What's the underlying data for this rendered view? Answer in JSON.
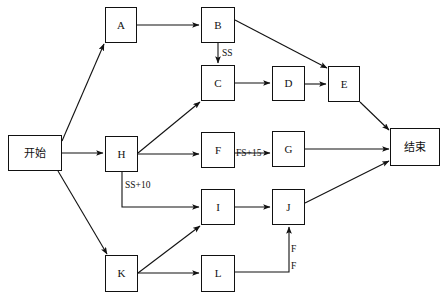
{
  "diagram": {
    "canvas": {
      "width": 446,
      "height": 308,
      "background": "#ffffff"
    },
    "stroke_color": "#111111",
    "nodes": [
      {
        "id": "start",
        "label": "开始",
        "x": 8,
        "y": 135,
        "w": 54,
        "h": 36,
        "type": "terminal"
      },
      {
        "id": "A",
        "label": "A",
        "x": 105,
        "y": 7,
        "w": 32,
        "h": 36,
        "type": "task"
      },
      {
        "id": "B",
        "label": "B",
        "x": 201,
        "y": 7,
        "w": 34,
        "h": 36,
        "type": "task"
      },
      {
        "id": "C",
        "label": "C",
        "x": 201,
        "y": 65,
        "w": 34,
        "h": 36,
        "type": "task"
      },
      {
        "id": "D",
        "label": "D",
        "x": 272,
        "y": 66,
        "w": 33,
        "h": 35,
        "type": "task"
      },
      {
        "id": "E",
        "label": "E",
        "x": 328,
        "y": 66,
        "w": 32,
        "h": 36,
        "type": "task"
      },
      {
        "id": "H",
        "label": "H",
        "x": 105,
        "y": 136,
        "w": 33,
        "h": 36,
        "type": "task"
      },
      {
        "id": "F",
        "label": "F",
        "x": 201,
        "y": 132,
        "w": 34,
        "h": 36,
        "type": "task"
      },
      {
        "id": "G",
        "label": "G",
        "x": 272,
        "y": 131,
        "w": 33,
        "h": 36,
        "type": "task"
      },
      {
        "id": "I",
        "label": "I",
        "x": 201,
        "y": 189,
        "w": 34,
        "h": 36,
        "type": "task"
      },
      {
        "id": "J",
        "label": "J",
        "x": 272,
        "y": 189,
        "w": 33,
        "h": 36,
        "type": "task"
      },
      {
        "id": "K",
        "label": "K",
        "x": 105,
        "y": 255,
        "w": 33,
        "h": 37,
        "type": "task"
      },
      {
        "id": "L",
        "label": "L",
        "x": 201,
        "y": 255,
        "w": 34,
        "h": 37,
        "type": "task"
      },
      {
        "id": "end",
        "label": "结束",
        "x": 390,
        "y": 128,
        "w": 50,
        "h": 38,
        "type": "terminal"
      }
    ],
    "edge_labels": [
      {
        "id": "ss",
        "text": "SS",
        "x": 222,
        "y": 49
      },
      {
        "id": "ss10",
        "text": "SS+10",
        "x": 125,
        "y": 181
      },
      {
        "id": "fs15",
        "text": "FS+15",
        "x": 236,
        "y": 149
      },
      {
        "id": "f-top",
        "text": "F",
        "x": 291,
        "y": 245
      },
      {
        "id": "f-bot",
        "text": "F",
        "x": 291,
        "y": 262
      }
    ],
    "edges": [
      {
        "id": "start-A",
        "from": "start",
        "to": "A",
        "path": "M 62 141 L 104 44",
        "label": ""
      },
      {
        "id": "A-B",
        "from": "A",
        "to": "B",
        "path": "M 137 25 L 199 25",
        "label": ""
      },
      {
        "id": "B-C",
        "from": "B",
        "to": "C",
        "path": "M 218 43 L 218 63",
        "label": "SS"
      },
      {
        "id": "B-E",
        "from": "B",
        "to": "E",
        "path": "M 235 20 L 327 68",
        "label": ""
      },
      {
        "id": "C-D",
        "from": "C",
        "to": "D",
        "path": "M 235 83 L 270 83",
        "label": ""
      },
      {
        "id": "D-E",
        "from": "D",
        "to": "E",
        "path": "M 305 84 L 326 84",
        "label": ""
      },
      {
        "id": "E-end",
        "from": "E",
        "to": "end",
        "path": "M 360 102 L 389 130",
        "label": ""
      },
      {
        "id": "start-H",
        "from": "start",
        "to": "H",
        "path": "M 62 153 L 103 153",
        "label": ""
      },
      {
        "id": "H-C",
        "from": "H",
        "to": "C",
        "path": "M 138 153 L 200 102",
        "label": ""
      },
      {
        "id": "H-F",
        "from": "H",
        "to": "F",
        "path": "M 138 154 L 199 154",
        "label": ""
      },
      {
        "id": "H-I",
        "from": "H",
        "to": "I",
        "path": "M 122 172 L 122 207 L 199 207",
        "label": "SS+10"
      },
      {
        "id": "F-G",
        "from": "F",
        "to": "G",
        "path": "M 235 153 L 270 153",
        "label": "FS+15"
      },
      {
        "id": "G-end",
        "from": "G",
        "to": "end",
        "path": "M 305 149 L 389 149",
        "label": ""
      },
      {
        "id": "start-K",
        "from": "start",
        "to": "K",
        "path": "M 58 171 L 107 254",
        "label": ""
      },
      {
        "id": "K-I",
        "from": "K",
        "to": "I",
        "path": "M 138 273 L 200 226",
        "label": ""
      },
      {
        "id": "I-J",
        "from": "I",
        "to": "J",
        "path": "M 235 207 L 270 207",
        "label": ""
      },
      {
        "id": "J-end",
        "from": "J",
        "to": "end",
        "path": "M 305 203 L 389 161",
        "label": ""
      },
      {
        "id": "K-L",
        "from": "K",
        "to": "L",
        "path": "M 138 273 L 199 273",
        "label": ""
      },
      {
        "id": "L-J",
        "from": "L",
        "to": "J",
        "path": "M 235 272 L 289 272 L 289 227",
        "label": "F F"
      }
    ]
  }
}
